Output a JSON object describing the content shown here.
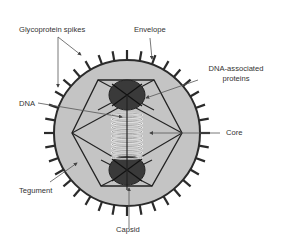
{
  "diagram": {
    "labels": {
      "glycoprotein_spikes": "Glycoprotein spikes",
      "envelope": "Envelope",
      "dna_associated_proteins_line1": "DNA-associated",
      "dna_associated_proteins_line2": "proteins",
      "dna": "DNA",
      "core": "Core",
      "tegument": "Tegument",
      "capsid": "Capsid"
    },
    "colors": {
      "background": "#ffffff",
      "tegument_fill": "#c4c4c4",
      "envelope_stroke": "#2b2b2b",
      "spike": "#2b2b2b",
      "dna_protein_fill": "#3a3a3a",
      "dna_coil": "#ffffff",
      "leader_line": "#555555",
      "text": "#333333"
    }
  }
}
